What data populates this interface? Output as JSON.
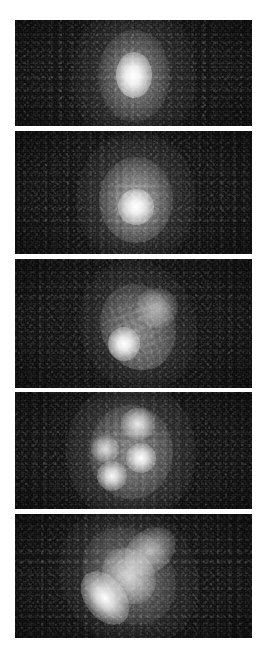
{
  "figure": {
    "title": "",
    "caption": "",
    "background_color": "#ffffff",
    "panel_background_color": "#0a0a0a",
    "emission_color": "#ffffff",
    "canvas": {
      "width": 263,
      "height": 655
    },
    "layout": {
      "arrangement": "vertical-strip",
      "panel_count": 5,
      "panel_left": 15,
      "panel_right": 252,
      "panel_width": 237,
      "gap": 5
    },
    "panels": [
      {
        "index": 1,
        "label": "",
        "x": 15,
        "y": 20,
        "width": 237,
        "height": 106,
        "description": "compact single bright core on dark noisy field",
        "sources": [
          {
            "name": "core",
            "cx": 50,
            "cy": 52,
            "rx": 15,
            "ry": 20,
            "peak": 100
          },
          {
            "name": "halo",
            "cx": 50,
            "cy": 53,
            "rx": 30,
            "ry": 40,
            "peak": 45
          },
          {
            "name": "outer-halo",
            "cx": 50,
            "cy": 53,
            "rx": 52,
            "ry": 72,
            "peak": 18
          }
        ]
      },
      {
        "index": 2,
        "label": "",
        "x": 15,
        "y": 131,
        "width": 237,
        "height": 123,
        "description": "larger diffuse round blob, broader and softer than panel 1",
        "sources": [
          {
            "name": "core",
            "cx": 51,
            "cy": 62,
            "rx": 14,
            "ry": 15,
            "peak": 100
          },
          {
            "name": "halo",
            "cx": 51,
            "cy": 56,
            "rx": 30,
            "ry": 36,
            "peak": 55
          },
          {
            "name": "outer-halo",
            "cx": 51,
            "cy": 55,
            "rx": 50,
            "ry": 62,
            "peak": 22
          }
        ]
      },
      {
        "index": 3,
        "label": "",
        "x": 15,
        "y": 259,
        "width": 237,
        "height": 129,
        "description": "bright core toward lower-left with a fainter extended lobe to the upper-right",
        "sources": [
          {
            "name": "core",
            "cx": 46,
            "cy": 66,
            "rx": 12,
            "ry": 14,
            "peak": 100
          },
          {
            "name": "secondary-lobe",
            "cx": 60,
            "cy": 38,
            "rx": 17,
            "ry": 16,
            "peak": 48
          },
          {
            "name": "halo",
            "cx": 52,
            "cy": 53,
            "rx": 30,
            "ry": 36,
            "peak": 40
          },
          {
            "name": "outer-halo",
            "cx": 52,
            "cy": 52,
            "rx": 48,
            "ry": 58,
            "peak": 17
          }
        ]
      },
      {
        "index": 4,
        "label": "",
        "x": 15,
        "y": 392,
        "width": 237,
        "height": 117,
        "description": "resolved into several distinct knots embedded in a broad diffuse envelope",
        "sources": [
          {
            "name": "knot-center",
            "cx": 53,
            "cy": 56,
            "rx": 10,
            "ry": 10,
            "peak": 100
          },
          {
            "name": "knot-lower-left",
            "cx": 41,
            "cy": 72,
            "rx": 10,
            "ry": 10,
            "peak": 92
          },
          {
            "name": "knot-upper",
            "cx": 52,
            "cy": 27,
            "rx": 11,
            "ry": 11,
            "peak": 80
          },
          {
            "name": "knot-left",
            "cx": 38,
            "cy": 49,
            "rx": 9,
            "ry": 9,
            "peak": 72
          },
          {
            "name": "envelope",
            "cx": 49,
            "cy": 51,
            "rx": 34,
            "ry": 40,
            "peak": 38
          },
          {
            "name": "outer-envelope",
            "cx": 49,
            "cy": 51,
            "rx": 55,
            "ry": 62,
            "peak": 18
          }
        ]
      },
      {
        "index": 5,
        "label": "",
        "x": 15,
        "y": 514,
        "width": 237,
        "height": 124,
        "description": "elongated diagonal structure running from lower-left to upper-right",
        "sources": [
          {
            "name": "bright-ridge",
            "cx": 38,
            "cy": 68,
            "rx": 12,
            "ry": 20,
            "peak": 100,
            "angle": -38
          },
          {
            "name": "mid-ridge",
            "cx": 48,
            "cy": 50,
            "rx": 14,
            "ry": 24,
            "peak": 70,
            "angle": -38
          },
          {
            "name": "upper-ridge",
            "cx": 57,
            "cy": 30,
            "rx": 14,
            "ry": 16,
            "peak": 58,
            "angle": -38
          },
          {
            "name": "envelope",
            "cx": 48,
            "cy": 50,
            "rx": 36,
            "ry": 44,
            "peak": 30,
            "angle": -38
          },
          {
            "name": "outer-envelope",
            "cx": 48,
            "cy": 50,
            "rx": 56,
            "ry": 64,
            "peak": 14,
            "angle": -38
          }
        ]
      }
    ]
  }
}
